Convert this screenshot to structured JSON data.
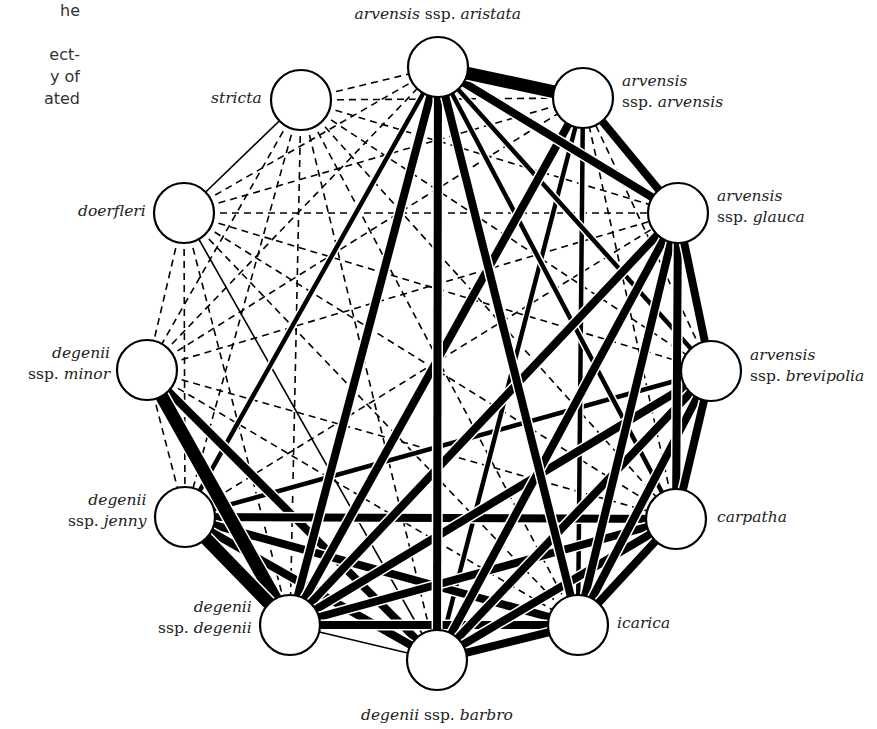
{
  "caption_fragment": [
    "he",
    "",
    "ect-",
    "y of",
    "ated"
  ],
  "nodes": [
    {
      "id": "aristata",
      "x": 438,
      "y": 67,
      "label_lines": [
        [
          {
            "t": "arvensis",
            "i": true
          },
          {
            "t": " ssp. ",
            "i": false
          },
          {
            "t": "aristata",
            "i": true
          }
        ]
      ]
    },
    {
      "id": "arvensis",
      "x": 583,
      "y": 98,
      "label_lines": [
        [
          {
            "t": "arvensis",
            "i": true
          }
        ],
        [
          {
            "t": "ssp. ",
            "i": false
          },
          {
            "t": "arvensis",
            "i": true
          }
        ]
      ]
    },
    {
      "id": "glauca",
      "x": 678,
      "y": 213,
      "label_lines": [
        [
          {
            "t": "arvensis",
            "i": true
          }
        ],
        [
          {
            "t": "ssp. ",
            "i": false
          },
          {
            "t": "glauca",
            "i": true
          }
        ]
      ]
    },
    {
      "id": "brevipolia",
      "x": 711,
      "y": 371,
      "label_lines": [
        [
          {
            "t": "arvensis",
            "i": true
          }
        ],
        [
          {
            "t": "ssp. ",
            "i": false
          },
          {
            "t": "brevipolia",
            "i": true
          }
        ]
      ]
    },
    {
      "id": "carpatha",
      "x": 676,
      "y": 519,
      "label_lines": [
        [
          {
            "t": "carpatha",
            "i": true
          }
        ]
      ]
    },
    {
      "id": "icarica",
      "x": 578,
      "y": 625,
      "label_lines": [
        [
          {
            "t": "icarica",
            "i": true
          }
        ]
      ]
    },
    {
      "id": "barbro",
      "x": 437,
      "y": 660,
      "label_lines": [
        [
          {
            "t": "degenii",
            "i": true
          },
          {
            "t": " ssp. ",
            "i": false
          },
          {
            "t": "barbro",
            "i": true
          }
        ]
      ]
    },
    {
      "id": "degenii",
      "x": 290,
      "y": 625,
      "label_lines": [
        [
          {
            "t": "degenii",
            "i": true
          }
        ],
        [
          {
            "t": "ssp. ",
            "i": false
          },
          {
            "t": "degenii",
            "i": true
          }
        ]
      ]
    },
    {
      "id": "jenny",
      "x": 185,
      "y": 517,
      "label_lines": [
        [
          {
            "t": "degenii",
            "i": true
          }
        ],
        [
          {
            "t": "ssp. ",
            "i": false
          },
          {
            "t": "jenny",
            "i": true
          }
        ]
      ]
    },
    {
      "id": "minor",
      "x": 147,
      "y": 370,
      "label_lines": [
        [
          {
            "t": "degenii",
            "i": true
          }
        ],
        [
          {
            "t": "ssp. ",
            "i": false
          },
          {
            "t": "minor",
            "i": true
          }
        ]
      ]
    },
    {
      "id": "doerfleri",
      "x": 184,
      "y": 213,
      "label_lines": [
        [
          {
            "t": "doerfleri",
            "i": true
          }
        ]
      ]
    },
    {
      "id": "stricta",
      "x": 301,
      "y": 100,
      "label_lines": [
        [
          {
            "t": "stricta",
            "i": true
          }
        ]
      ]
    }
  ],
  "labels": {
    "aristata": {
      "x": 438,
      "y": 4,
      "align": "c"
    },
    "arvensis": {
      "x": 622,
      "y": 71,
      "align": "l"
    },
    "glauca": {
      "x": 717,
      "y": 186,
      "align": "l"
    },
    "brevipolia": {
      "x": 750,
      "y": 345,
      "align": "l"
    },
    "carpatha": {
      "x": 717,
      "y": 507,
      "align": "l"
    },
    "icarica": {
      "x": 617,
      "y": 613,
      "align": "l"
    },
    "barbro": {
      "x": 437,
      "y": 705,
      "align": "c"
    },
    "degenii": {
      "x": 252,
      "y": 597,
      "align": "r"
    },
    "jenny": {
      "x": 146,
      "y": 490,
      "align": "r"
    },
    "minor": {
      "x": 110,
      "y": 343,
      "align": "r"
    },
    "doerfleri": {
      "x": 146,
      "y": 201,
      "align": "r"
    },
    "stricta": {
      "x": 262,
      "y": 88,
      "align": "r"
    }
  },
  "node_radius": 30,
  "edge_styles": {
    "dashed": {
      "width": 1.6,
      "dash": "7,5"
    },
    "thin": {
      "width": 1.6
    },
    "medium": {
      "width": 4.5
    },
    "thick": {
      "width": 8
    },
    "heavy": {
      "width": 13
    }
  },
  "edges": [
    [
      "stricta",
      "doerfleri",
      "thin"
    ],
    [
      "stricta",
      "aristata",
      "dashed"
    ],
    [
      "stricta",
      "arvensis",
      "dashed"
    ],
    [
      "stricta",
      "glauca",
      "dashed"
    ],
    [
      "stricta",
      "brevipolia",
      "dashed"
    ],
    [
      "stricta",
      "carpatha",
      "dashed"
    ],
    [
      "stricta",
      "icarica",
      "dashed"
    ],
    [
      "stricta",
      "barbro",
      "dashed"
    ],
    [
      "stricta",
      "degenii",
      "dashed"
    ],
    [
      "stricta",
      "jenny",
      "dashed"
    ],
    [
      "stricta",
      "minor",
      "dashed"
    ],
    [
      "doerfleri",
      "aristata",
      "dashed"
    ],
    [
      "doerfleri",
      "arvensis",
      "dashed"
    ],
    [
      "doerfleri",
      "glauca",
      "dashed"
    ],
    [
      "doerfleri",
      "brevipolia",
      "dashed"
    ],
    [
      "doerfleri",
      "carpatha",
      "dashed"
    ],
    [
      "doerfleri",
      "icarica",
      "dashed"
    ],
    [
      "doerfleri",
      "barbro",
      "thin"
    ],
    [
      "doerfleri",
      "degenii",
      "dashed"
    ],
    [
      "doerfleri",
      "jenny",
      "dashed"
    ],
    [
      "doerfleri",
      "minor",
      "dashed"
    ],
    [
      "minor",
      "aristata",
      "dashed"
    ],
    [
      "minor",
      "arvensis",
      "dashed"
    ],
    [
      "minor",
      "glauca",
      "dashed"
    ],
    [
      "minor",
      "jenny",
      "dashed"
    ],
    [
      "minor",
      "degenii",
      "heavy"
    ],
    [
      "minor",
      "barbro",
      "thick"
    ],
    [
      "minor",
      "icarica",
      "dashed"
    ],
    [
      "minor",
      "carpatha",
      "dashed"
    ],
    [
      "jenny",
      "aristata",
      "medium"
    ],
    [
      "jenny",
      "glauca",
      "dashed"
    ],
    [
      "jenny",
      "brevipolia",
      "medium"
    ],
    [
      "jenny",
      "carpatha",
      "thick"
    ],
    [
      "jenny",
      "icarica",
      "thick"
    ],
    [
      "jenny",
      "barbro",
      "thick"
    ],
    [
      "jenny",
      "degenii",
      "heavy"
    ],
    [
      "degenii",
      "aristata",
      "thick"
    ],
    [
      "degenii",
      "arvensis",
      "thick"
    ],
    [
      "degenii",
      "glauca",
      "thick"
    ],
    [
      "degenii",
      "brevipolia",
      "thick"
    ],
    [
      "degenii",
      "carpatha",
      "thick"
    ],
    [
      "degenii",
      "icarica",
      "thick"
    ],
    [
      "degenii",
      "barbro",
      "thin"
    ],
    [
      "barbro",
      "aristata",
      "thick"
    ],
    [
      "barbro",
      "arvensis",
      "medium"
    ],
    [
      "barbro",
      "glauca",
      "thick"
    ],
    [
      "barbro",
      "brevipolia",
      "thick"
    ],
    [
      "barbro",
      "carpatha",
      "thick"
    ],
    [
      "barbro",
      "icarica",
      "thick"
    ],
    [
      "icarica",
      "aristata",
      "thick"
    ],
    [
      "icarica",
      "arvensis",
      "medium"
    ],
    [
      "icarica",
      "glauca",
      "thick"
    ],
    [
      "icarica",
      "brevipolia",
      "thick"
    ],
    [
      "icarica",
      "carpatha",
      "thick"
    ],
    [
      "carpatha",
      "aristata",
      "medium"
    ],
    [
      "carpatha",
      "arvensis",
      "dashed"
    ],
    [
      "carpatha",
      "glauca",
      "thick"
    ],
    [
      "carpatha",
      "brevipolia",
      "thick"
    ],
    [
      "brevipolia",
      "aristata",
      "medium"
    ],
    [
      "brevipolia",
      "arvensis",
      "dashed"
    ],
    [
      "brevipolia",
      "glauca",
      "thick"
    ],
    [
      "glauca",
      "aristata",
      "thick"
    ],
    [
      "glauca",
      "arvensis",
      "thick"
    ],
    [
      "arvensis",
      "aristata",
      "heavy"
    ]
  ]
}
